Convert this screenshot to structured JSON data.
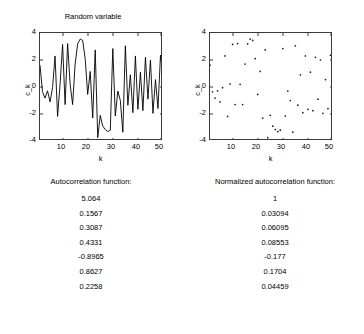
{
  "figure": {
    "background_color": "#ffffff",
    "axis_color": "#3a3a3a",
    "data_color": "#000000"
  },
  "charts": [
    {
      "title": "Random variable",
      "xlabel": "k",
      "ylabel": "c_k",
      "xticks": [
        "10",
        "20",
        "30",
        "40",
        "50"
      ],
      "yticks": [
        "4",
        "2",
        "0",
        "-2",
        "-4"
      ]
    },
    {
      "title": "",
      "xlabel": "k",
      "ylabel": "c_k",
      "xticks": [
        "10",
        "20",
        "30",
        "40",
        "50"
      ],
      "yticks": [
        "4",
        "2",
        "0",
        "-2",
        "-4"
      ]
    }
  ],
  "results": {
    "left_header": "Autocorrelation function:",
    "right_header": "Normalized autocorrelation function:",
    "left_values": [
      "5.064",
      "0.1567",
      "0.3087",
      "0.4331",
      "-0.8965",
      "0.8627",
      "0.2258"
    ],
    "right_values": [
      "1",
      "0.03094",
      "0.06095",
      "0.08553",
      "-0.177",
      "0.1704",
      "0.04459"
    ]
  },
  "chart_data": [
    {
      "type": "line",
      "title": "Random variable",
      "xlabel": "k",
      "ylabel": "c_k",
      "xlim": [
        1,
        50
      ],
      "ylim": [
        -4,
        4
      ],
      "xticks": [
        10,
        20,
        30,
        40,
        50
      ],
      "yticks": [
        -4,
        -2,
        0,
        2,
        4
      ],
      "grid": false,
      "legend": null,
      "x": [
        1,
        2,
        3,
        4,
        5,
        6,
        7,
        8,
        9,
        10,
        11,
        12,
        13,
        14,
        15,
        16,
        17,
        18,
        19,
        20,
        21,
        22,
        23,
        24,
        25,
        26,
        27,
        28,
        29,
        30,
        31,
        32,
        33,
        34,
        35,
        36,
        37,
        38,
        39,
        40,
        41,
        42,
        43,
        44,
        45,
        46,
        47,
        48,
        49,
        50
      ],
      "y": [
        1.62,
        -0.35,
        -0.82,
        -0.28,
        -1.1,
        -0.05,
        2.3,
        -2.18,
        0.22,
        3.15,
        -1.3,
        3.22,
        0.2,
        -1.3,
        1.7,
        3.2,
        3.55,
        3.45,
        2.1,
        -0.55,
        1.15,
        -2.3,
        2.75,
        -3.75,
        -2.1,
        -2.9,
        -3.15,
        -3.3,
        -3.2,
        2.85,
        -2.15,
        -0.3,
        -1.0,
        -3.35,
        3.05,
        -1.35,
        0.9,
        -1.9,
        2.3,
        -1.65,
        1.1,
        -1.75,
        2.2,
        -0.9,
        2.0,
        -1.95,
        0.55,
        -1.6,
        2.35,
        0.95
      ]
    },
    {
      "type": "scatter",
      "title": "",
      "xlabel": "k",
      "ylabel": "c_k",
      "xlim": [
        1,
        50
      ],
      "ylim": [
        -4,
        4
      ],
      "xticks": [
        10,
        20,
        30,
        40,
        50
      ],
      "yticks": [
        -4,
        -2,
        0,
        2,
        4
      ],
      "grid": false,
      "legend": null,
      "x": [
        1,
        2,
        3,
        4,
        5,
        6,
        7,
        8,
        9,
        10,
        11,
        12,
        13,
        14,
        15,
        16,
        17,
        18,
        19,
        20,
        21,
        22,
        23,
        24,
        25,
        26,
        27,
        28,
        29,
        30,
        31,
        32,
        33,
        34,
        35,
        36,
        37,
        38,
        39,
        40,
        41,
        42,
        43,
        44,
        45,
        46,
        47,
        48,
        49,
        50
      ],
      "y": [
        1.62,
        -0.35,
        -0.82,
        -0.28,
        -1.1,
        -0.05,
        2.3,
        -2.18,
        0.22,
        3.15,
        -1.3,
        3.22,
        0.2,
        -1.3,
        1.7,
        3.2,
        3.55,
        3.45,
        2.1,
        -0.55,
        1.15,
        -2.3,
        2.75,
        -3.75,
        -2.1,
        -2.9,
        -3.15,
        -3.3,
        -3.2,
        2.85,
        -2.15,
        -0.3,
        -1.0,
        -3.35,
        3.05,
        -1.35,
        0.9,
        -1.9,
        2.3,
        -1.65,
        1.1,
        -1.75,
        2.2,
        -0.9,
        2.0,
        -1.95,
        0.55,
        -1.6,
        2.35,
        0.95
      ]
    }
  ]
}
